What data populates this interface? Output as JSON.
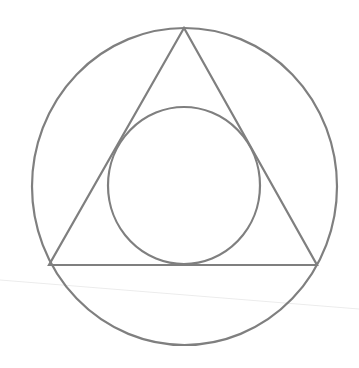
{
  "diagram": {
    "title": "",
    "colors": {
      "stroke": "#7f7f7f",
      "faint_line": "#ececec",
      "background": "#ffffff"
    },
    "shapes": {
      "outer_circle": {
        "cx": 184.5,
        "cy": 186.5,
        "rx": 152.5,
        "ry": 158.5,
        "stroke_width": 2.2
      },
      "triangle": {
        "points": [
          [
            184,
            28
          ],
          [
            49,
            265
          ],
          [
            317,
            265
          ]
        ],
        "stroke_width": 2.2
      },
      "inner_circle": {
        "cx": 184,
        "cy": 185.5,
        "rx": 76,
        "ry": 78.5,
        "stroke_width": 2.2
      },
      "faint_line": {
        "x1": 0,
        "y1": 280,
        "x2": 359,
        "y2": 309,
        "stroke_width": 1.2
      }
    }
  }
}
